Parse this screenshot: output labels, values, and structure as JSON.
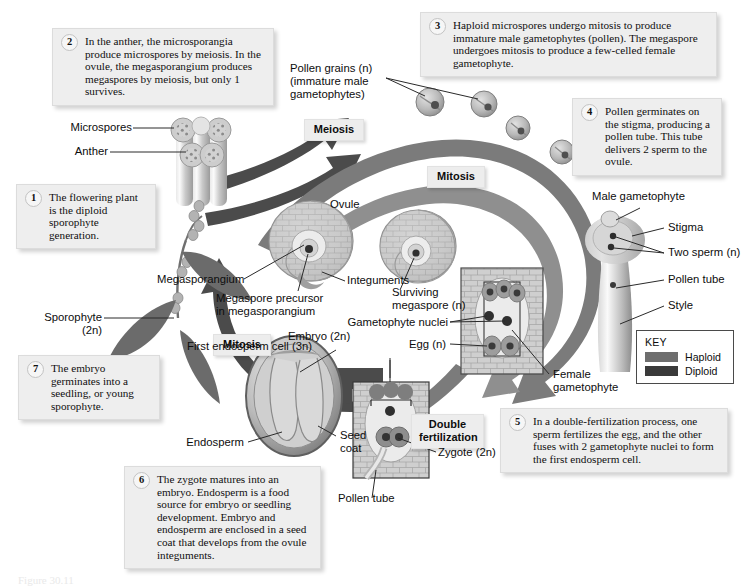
{
  "figure": {
    "caption": "Figure 30.11"
  },
  "colors": {
    "haploid": "#6e6e6e",
    "diploid": "#3a3a3a",
    "callout_bg": "#eeeeee",
    "stage_bg": "#ededed",
    "tissue_light": "#d6d6d6",
    "tissue_mid": "#b0b0b0",
    "tissue_dark": "#7c7c7c"
  },
  "steps": [
    {
      "number": "1",
      "text": "The flowering plant is the diploid sporophyte generation."
    },
    {
      "number": "2",
      "text": "In the anther, the microsporangia produce microspores by meiosis. In the ovule, the megasporangium produces megaspores by meiosis, but only 1 survives."
    },
    {
      "number": "3",
      "text": "Haploid microspores undergo mitosis to produce immature male gametophytes (pollen). The megaspore undergoes mitosis to produce a few-celled female gametophyte."
    },
    {
      "number": "4",
      "text": "Pollen germinates on the stigma, producing a pollen tube. This tube delivers 2 sperm to the ovule."
    },
    {
      "number": "5",
      "text": "In a double-fertilization process, one sperm fertilizes the egg, and the other fuses with 2 gametophyte nuclei to form the first endosperm cell."
    },
    {
      "number": "6",
      "text": "The zygote matures into an embryo. Endosperm is a food source for embryo or seedling development. Embryo and endosperm are enclosed in a seed coat that develops from the ovule integuments."
    },
    {
      "number": "7",
      "text": "The embryo germinates into a seedling, or young sporophyte."
    }
  ],
  "stage_labels": [
    {
      "name": "meiosis",
      "text": "Meiosis"
    },
    {
      "name": "mitosis-top",
      "text": "Mitosis"
    },
    {
      "name": "mitosis-left",
      "text": "Mitosis"
    },
    {
      "name": "mitosis-right",
      "text": "Mitosis"
    },
    {
      "name": "double-fertilization",
      "text": "Double\nfertilization"
    }
  ],
  "labels": {
    "microspores": "Microspores",
    "anther": "Anther",
    "pollen_grains": "Pollen grains (n)\n(immature male\ngametophytes)",
    "sporophyte": "Sporophyte (2n)",
    "ovule": "Ovule",
    "megasporangium": "Megasporangium",
    "megaspore_precursor": "Megaspore precursor\nin megasporangium",
    "integuments": "Integuments",
    "surviving_megaspore": "Surviving\nmegaspore (n)",
    "gametophyte_nuclei": "Gametophyte nuclei",
    "egg": "Egg (n)",
    "first_endosperm_cell": "First endosperm cell (3n)",
    "female_gametophyte": "Female\ngametophyte",
    "male_gametophyte": "Male gametophyte",
    "stigma": "Stigma",
    "two_sperm": "Two sperm (n)",
    "pollen_tube_right": "Pollen tube",
    "style": "Style",
    "embryo": "Embryo (2n)",
    "endosperm": "Endosperm",
    "seed_coat": "Seed\ncoat",
    "zygote": "Zygote (2n)",
    "pollen_tube_bottom": "Pollen tube"
  },
  "key": {
    "title": "KEY",
    "entries": [
      {
        "label": "Haploid",
        "color": "#6e6e6e"
      },
      {
        "label": "Diploid",
        "color": "#3a3a3a"
      }
    ]
  }
}
